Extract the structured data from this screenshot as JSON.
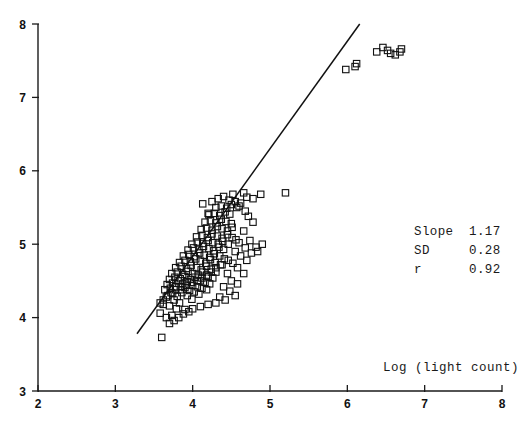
{
  "chart_data": {
    "type": "scatter",
    "title": "",
    "subtitle": "",
    "xlabel": "Log (light count)",
    "ylabel": "",
    "xlim": [
      2,
      8
    ],
    "ylim": [
      3,
      8
    ],
    "xticks": [
      "2",
      "3",
      "4",
      "5",
      "6",
      "7",
      "8"
    ],
    "yticks": [
      "3",
      "4",
      "5",
      "6",
      "7",
      "8"
    ],
    "grid": false,
    "legend": null,
    "marker_style": "open-square",
    "annotations": {
      "slope_label": "Slope",
      "slope_value": "1.17",
      "sd_label": "SD",
      "sd_value": "0.28",
      "r_label": "r",
      "r_value": "0.92",
      "position": "right-middle"
    },
    "fit_line": {
      "type": "linear-regression",
      "slope": 1.17,
      "x_start": 3.28,
      "y_start": 3.78,
      "x_end": 6.16,
      "y_end": 8.0
    },
    "points": [
      [
        3.6,
        3.73
      ],
      [
        3.58,
        4.06
      ],
      [
        3.66,
        4.0
      ],
      [
        3.73,
        4.03
      ],
      [
        3.79,
        4.12
      ],
      [
        3.62,
        4.18
      ],
      [
        3.7,
        4.16
      ],
      [
        3.83,
        4.2
      ],
      [
        3.9,
        4.11
      ],
      [
        3.76,
        4.24
      ],
      [
        3.68,
        4.3
      ],
      [
        3.74,
        4.33
      ],
      [
        3.8,
        4.29
      ],
      [
        3.86,
        4.34
      ],
      [
        3.93,
        4.3
      ],
      [
        3.99,
        4.25
      ],
      [
        3.64,
        4.38
      ],
      [
        3.71,
        4.4
      ],
      [
        3.78,
        4.42
      ],
      [
        3.84,
        4.38
      ],
      [
        3.9,
        4.41
      ],
      [
        3.96,
        4.37
      ],
      [
        4.02,
        4.35
      ],
      [
        4.08,
        4.32
      ],
      [
        3.67,
        4.45
      ],
      [
        3.74,
        4.47
      ],
      [
        3.81,
        4.5
      ],
      [
        3.87,
        4.46
      ],
      [
        3.93,
        4.49
      ],
      [
        4.0,
        4.44
      ],
      [
        4.06,
        4.42
      ],
      [
        4.12,
        4.4
      ],
      [
        4.18,
        4.38
      ],
      [
        3.7,
        4.52
      ],
      [
        3.77,
        4.55
      ],
      [
        3.84,
        4.53
      ],
      [
        3.9,
        4.56
      ],
      [
        3.97,
        4.52
      ],
      [
        4.03,
        4.55
      ],
      [
        4.1,
        4.5
      ],
      [
        4.16,
        4.48
      ],
      [
        4.22,
        4.46
      ],
      [
        3.73,
        4.6
      ],
      [
        3.8,
        4.62
      ],
      [
        3.87,
        4.59
      ],
      [
        3.94,
        4.63
      ],
      [
        4.0,
        4.6
      ],
      [
        4.07,
        4.58
      ],
      [
        4.13,
        4.62
      ],
      [
        4.2,
        4.56
      ],
      [
        4.26,
        4.54
      ],
      [
        3.78,
        4.68
      ],
      [
        3.85,
        4.7
      ],
      [
        3.92,
        4.67
      ],
      [
        3.98,
        4.71
      ],
      [
        4.05,
        4.68
      ],
      [
        4.11,
        4.65
      ],
      [
        4.18,
        4.7
      ],
      [
        4.24,
        4.66
      ],
      [
        4.3,
        4.62
      ],
      [
        3.83,
        4.75
      ],
      [
        3.9,
        4.78
      ],
      [
        3.97,
        4.76
      ],
      [
        4.04,
        4.8
      ],
      [
        4.1,
        4.77
      ],
      [
        4.17,
        4.74
      ],
      [
        4.23,
        4.79
      ],
      [
        4.29,
        4.75
      ],
      [
        4.36,
        4.72
      ],
      [
        3.88,
        4.84
      ],
      [
        3.95,
        4.86
      ],
      [
        4.02,
        4.83
      ],
      [
        4.09,
        4.88
      ],
      [
        4.15,
        4.85
      ],
      [
        4.22,
        4.82
      ],
      [
        4.28,
        4.87
      ],
      [
        4.35,
        4.84
      ],
      [
        4.41,
        4.8
      ],
      [
        3.94,
        4.92
      ],
      [
        4.01,
        4.95
      ],
      [
        4.08,
        4.93
      ],
      [
        4.14,
        4.97
      ],
      [
        4.21,
        4.94
      ],
      [
        4.27,
        4.91
      ],
      [
        4.34,
        4.96
      ],
      [
        4.4,
        4.93
      ],
      [
        3.99,
        5.0
      ],
      [
        4.06,
        5.03
      ],
      [
        4.13,
        5.01
      ],
      [
        4.2,
        5.05
      ],
      [
        4.26,
        5.02
      ],
      [
        4.33,
        5.0
      ],
      [
        4.39,
        5.04
      ],
      [
        4.46,
        5.0
      ],
      [
        4.05,
        5.1
      ],
      [
        4.12,
        5.12
      ],
      [
        4.19,
        5.09
      ],
      [
        4.25,
        5.14
      ],
      [
        4.32,
        5.11
      ],
      [
        4.38,
        5.08
      ],
      [
        4.45,
        5.13
      ],
      [
        4.51,
        5.09
      ],
      [
        4.11,
        5.2
      ],
      [
        4.18,
        5.22
      ],
      [
        4.25,
        5.19
      ],
      [
        4.32,
        5.24
      ],
      [
        4.38,
        5.21
      ],
      [
        4.45,
        5.18
      ],
      [
        4.51,
        5.23
      ],
      [
        4.16,
        5.3
      ],
      [
        4.23,
        5.32
      ],
      [
        4.3,
        5.29
      ],
      [
        4.37,
        5.34
      ],
      [
        4.43,
        5.31
      ],
      [
        4.5,
        5.28
      ],
      [
        4.21,
        5.4
      ],
      [
        4.28,
        5.42
      ],
      [
        4.35,
        5.39
      ],
      [
        4.42,
        5.44
      ],
      [
        4.48,
        5.41
      ],
      [
        4.3,
        5.5
      ],
      [
        4.37,
        5.52
      ],
      [
        4.44,
        5.49
      ],
      [
        4.5,
        5.54
      ],
      [
        4.57,
        5.5
      ],
      [
        4.13,
        5.55
      ],
      [
        4.33,
        5.62
      ],
      [
        4.4,
        5.65
      ],
      [
        4.47,
        5.6
      ],
      [
        4.55,
        5.58
      ],
      [
        4.62,
        5.56
      ],
      [
        4.52,
        5.68
      ],
      [
        4.2,
        5.42
      ],
      [
        4.25,
        5.58
      ],
      [
        4.6,
        5.52
      ],
      [
        4.68,
        5.45
      ],
      [
        4.72,
        5.38
      ],
      [
        4.78,
        5.3
      ],
      [
        4.66,
        5.18
      ],
      [
        4.74,
        5.05
      ],
      [
        4.82,
        4.96
      ],
      [
        4.6,
        5.02
      ],
      [
        4.55,
        4.9
      ],
      [
        4.62,
        4.84
      ],
      [
        4.7,
        4.78
      ],
      [
        4.52,
        4.74
      ],
      [
        4.58,
        4.68
      ],
      [
        4.66,
        4.6
      ],
      [
        4.45,
        4.6
      ],
      [
        4.5,
        4.5
      ],
      [
        4.58,
        4.46
      ],
      [
        4.4,
        4.42
      ],
      [
        4.48,
        4.36
      ],
      [
        4.55,
        4.3
      ],
      [
        4.35,
        4.28
      ],
      [
        4.42,
        4.24
      ],
      [
        4.3,
        4.2
      ],
      [
        4.2,
        4.18
      ],
      [
        4.1,
        4.15
      ],
      [
        4.0,
        4.12
      ],
      [
        3.95,
        4.08
      ],
      [
        3.88,
        4.05
      ],
      [
        3.82,
        4.0
      ],
      [
        3.76,
        3.96
      ],
      [
        3.7,
        3.92
      ],
      [
        4.46,
        4.78
      ],
      [
        4.38,
        4.72
      ],
      [
        4.3,
        4.68
      ],
      [
        4.24,
        4.62
      ],
      [
        4.18,
        4.58
      ],
      [
        4.12,
        4.54
      ],
      [
        4.06,
        4.5
      ],
      [
        3.99,
        4.48
      ],
      [
        3.92,
        4.44
      ],
      [
        3.85,
        4.42
      ],
      [
        3.78,
        4.38
      ],
      [
        3.72,
        4.34
      ],
      [
        3.66,
        4.28
      ],
      [
        3.62,
        4.24
      ],
      [
        3.58,
        4.2
      ],
      [
        5.2,
        5.7
      ],
      [
        4.88,
        5.68
      ],
      [
        4.78,
        5.62
      ],
      [
        4.7,
        5.64
      ],
      [
        4.66,
        5.7
      ],
      [
        5.98,
        7.38
      ],
      [
        6.12,
        7.46
      ],
      [
        6.1,
        7.42
      ],
      [
        6.38,
        7.62
      ],
      [
        6.46,
        7.68
      ],
      [
        6.52,
        7.64
      ],
      [
        6.56,
        7.6
      ],
      [
        6.68,
        7.62
      ],
      [
        6.7,
        7.66
      ],
      [
        6.62,
        7.58
      ],
      [
        4.9,
        5.0
      ],
      [
        4.84,
        4.9
      ],
      [
        4.76,
        4.88
      ],
      [
        4.68,
        4.95
      ],
      [
        4.56,
        5.06
      ]
    ]
  }
}
